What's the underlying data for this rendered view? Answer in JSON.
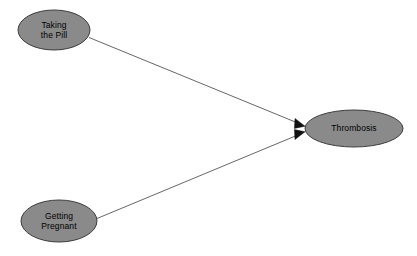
{
  "diagram": {
    "type": "causal-dag",
    "background_color": "#ffffff",
    "width": 417,
    "height": 256,
    "node_fill_color": "#8a8a8a",
    "node_stroke_color": "#3c3c3c",
    "edge_color": "#55555a",
    "label_color": "#000000",
    "nodes": [
      {
        "id": "taking-the-pill",
        "label": "Taking\nthe Pill",
        "lines": [
          "Taking",
          "the Pill"
        ],
        "shape": "ellipse",
        "cx": 54,
        "cy": 30,
        "rx": 36,
        "ry": 20
      },
      {
        "id": "getting-pregnant",
        "label": "Getting\nPregnant",
        "lines": [
          "Getting",
          "Pregnant"
        ],
        "shape": "ellipse",
        "cx": 59,
        "cy": 221,
        "rx": 38,
        "ry": 21
      },
      {
        "id": "thrombosis",
        "label": "Thrombosis",
        "lines": [
          "Thrombosis"
        ],
        "shape": "ellipse",
        "cx": 354,
        "cy": 128.5,
        "rx": 49,
        "ry": 18.5
      }
    ],
    "edges": [
      {
        "id": "edge-pill-to-thrombosis",
        "from": "taking-the-pill",
        "to": "thrombosis",
        "arrowhead": "filled-triangle",
        "x1": 89,
        "y1": 37,
        "x2": 303,
        "y2": 124
      },
      {
        "id": "edge-pregnant-to-thrombosis",
        "from": "getting-pregnant",
        "to": "thrombosis",
        "arrowhead": "filled-triangle",
        "x1": 97,
        "y1": 218,
        "x2": 303,
        "y2": 133
      }
    ]
  }
}
